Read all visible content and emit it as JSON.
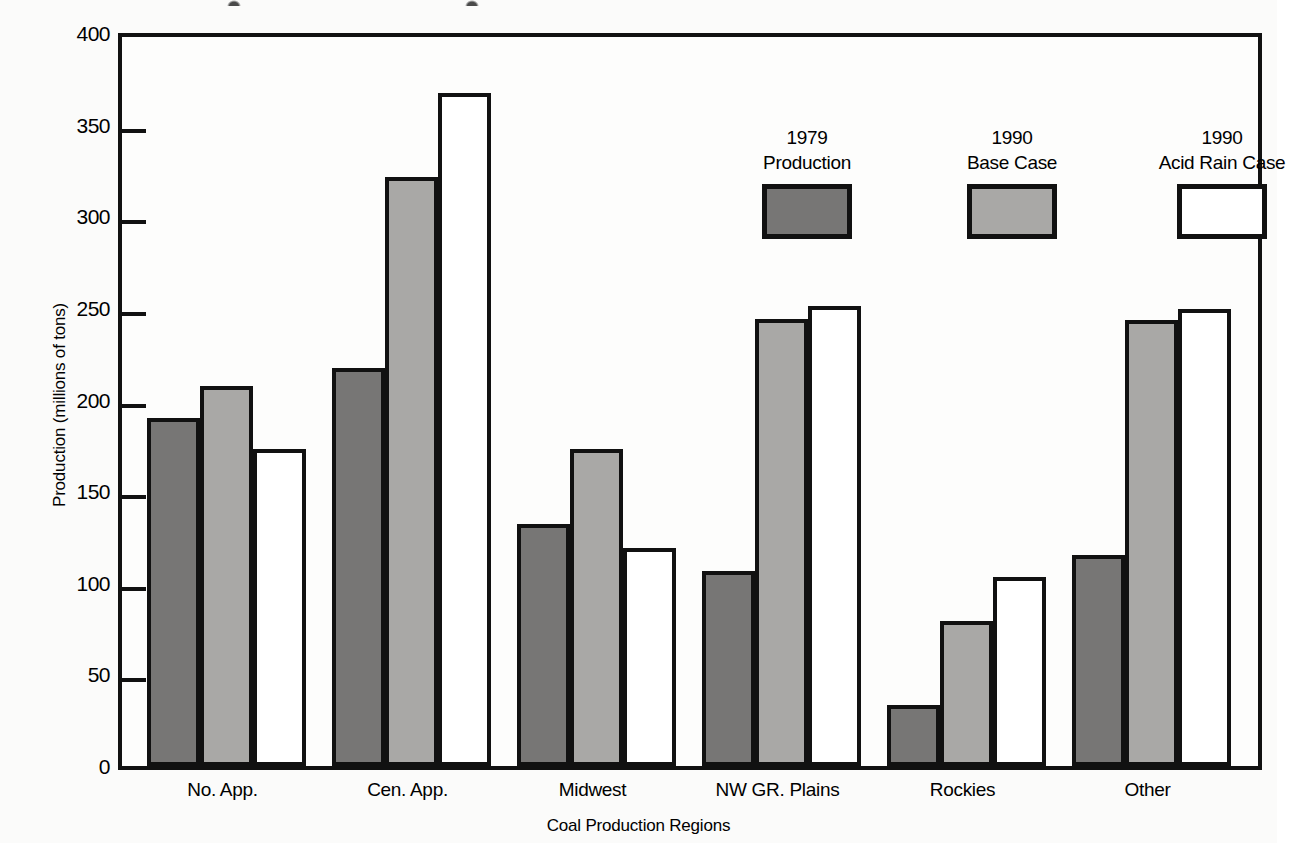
{
  "chart_data": {
    "type": "bar",
    "title": "",
    "xlabel": "Coal Production Regions",
    "ylabel": "Production (millions of tons)",
    "categories": [
      "No. App.",
      "Cen. App.",
      "Midwest",
      "NW GR. Plains",
      "Rockies",
      "Other"
    ],
    "series": [
      {
        "name": "1979 Production",
        "legend_line1": "1979",
        "legend_line2": "Production",
        "color": "#777675",
        "values": [
          188,
          215,
          130,
          104,
          31,
          113
        ]
      },
      {
        "name": "1990 Base Case",
        "legend_line1": "1990",
        "legend_line2": "Base Case",
        "color": "#a9a8a6",
        "values": [
          205,
          319,
          171,
          242,
          77,
          241
        ]
      },
      {
        "name": "1990 Acid Rain Case",
        "legend_line1": "1990",
        "legend_line2": "Acid Rain Case",
        "color": "#ffffff",
        "values": [
          171,
          365,
          117,
          249,
          101,
          247
        ]
      }
    ],
    "ylim": [
      0,
      400
    ],
    "yticks": [
      0,
      50,
      100,
      150,
      200,
      250,
      300,
      350,
      400
    ],
    "ytick_labels": [
      "0",
      "50",
      "100",
      "150",
      "200",
      "250",
      "300",
      "350",
      "400"
    ],
    "grid": false,
    "legend_position": "upper center inside"
  },
  "style": {
    "axis_color": "#111111",
    "background": "#fbfbfa",
    "plot_background": "#fdfdfc"
  }
}
